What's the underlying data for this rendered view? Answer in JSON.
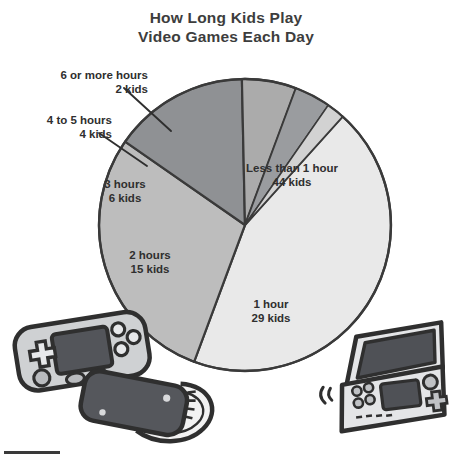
{
  "title": {
    "line1": "How Long Kids Play",
    "line2": "Video Games Each Day"
  },
  "chart_data": {
    "type": "pie",
    "title": "How Long Kids Play Video Games Each Day",
    "xlabel": "",
    "ylabel": "",
    "unit": "kids",
    "total": 100,
    "legend": "none",
    "grid": false,
    "categories": [
      "Less than 1 hour",
      "1 hour",
      "2 hours",
      "3 hours",
      "4 to 5 hours",
      "6 or more hours"
    ],
    "values": [
      44,
      29,
      15,
      6,
      4,
      2
    ],
    "slices": [
      {
        "label": "Less than 1 hour",
        "count": 44,
        "value_text": "44 kids",
        "color": "#e9e9e9",
        "placement": "inside"
      },
      {
        "label": "1 hour",
        "count": 29,
        "value_text": "29 kids",
        "color": "#bdbdbd",
        "placement": "inside"
      },
      {
        "label": "2 hours",
        "count": 15,
        "value_text": "15 kids",
        "color": "#8f9194",
        "placement": "inside"
      },
      {
        "label": "3 hours",
        "count": 6,
        "value_text": "6 kids",
        "color": "#ababab",
        "placement": "inside"
      },
      {
        "label": "4 to 5 hours",
        "count": 4,
        "value_text": "4 kids",
        "color": "#9a9c9f",
        "placement": "callout"
      },
      {
        "label": "6 or more hours",
        "count": 2,
        "value_text": "2 kids",
        "color": "#d2d2d2",
        "placement": "callout"
      }
    ]
  },
  "labels": {
    "six_or_more": {
      "name": "6 or more hours",
      "value": "2 kids"
    },
    "four_to_five": {
      "name": "4 to 5 hours",
      "value": "4 kids"
    },
    "three_hours": {
      "name": "3 hours",
      "value": "6 kids"
    },
    "two_hours": {
      "name": "2 hours",
      "value": "15 kids"
    },
    "less_than_one": {
      "name": "Less than 1 hour",
      "value": "44 kids"
    },
    "one_hour": {
      "name": "1 hour",
      "value": "29 kids"
    }
  },
  "decor": {
    "handheld_left": "handheld-game-console",
    "controller_left": "game-controller",
    "handheld_right": "dual-screen-handheld-console"
  },
  "colors": {
    "outline": "#3a3a3a",
    "text": "#3b3b3b",
    "slice_lightest": "#e9e9e9",
    "slice_light": "#d2d2d2",
    "slice_mid": "#bdbdbd",
    "slice_mid2": "#ababab",
    "slice_dark": "#9a9c9f",
    "slice_darkest": "#8f9194"
  }
}
